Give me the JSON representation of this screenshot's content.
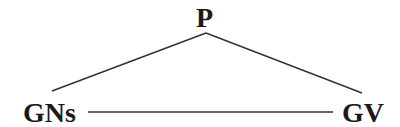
{
  "diagram": {
    "type": "tree-triangle",
    "nodes": {
      "top": {
        "label": "P"
      },
      "left": {
        "label": "GNs"
      },
      "right": {
        "label": "GV"
      }
    },
    "edges": [
      {
        "from": "P",
        "to": "GNs"
      },
      {
        "from": "P",
        "to": "GV"
      },
      {
        "from": "GNs",
        "to": "GV"
      }
    ],
    "colors": {
      "line": "#333333",
      "text": "#1a1a1a",
      "background": "#ffffff"
    }
  }
}
